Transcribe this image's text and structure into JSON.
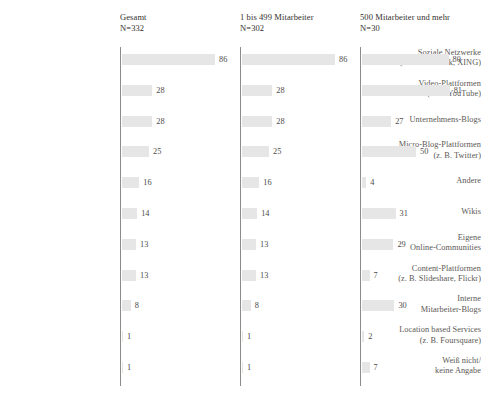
{
  "chart_data": {
    "type": "bar",
    "title": "",
    "xlabel": "",
    "ylabel": "",
    "grid": false,
    "legend_position": "top",
    "orientation": "horizontal",
    "xlim": [
      0,
      100
    ],
    "value_unit": "percent",
    "categories": [
      {
        "line1": "Soziale Netzwerke",
        "line2": "(z. B. Facebook, XING)"
      },
      {
        "line1": "Video-Plattformen",
        "line2": "(z. B. YouTube)"
      },
      {
        "line1": "Unternehmens-Blogs",
        "line2": ""
      },
      {
        "line1": "Micro-Blog-Plattformen",
        "line2": "(z. B. Twitter)"
      },
      {
        "line1": "Andere",
        "line2": ""
      },
      {
        "line1": "Wikis",
        "line2": ""
      },
      {
        "line1": "Eigene",
        "line2": "Online-Communities"
      },
      {
        "line1": "Content-Plattformen",
        "line2": "(z. B. Slideshare, Flickr)"
      },
      {
        "line1": "Interne",
        "line2": "Mitarbeiter-Blogs"
      },
      {
        "line1": "Location based Services",
        "line2": "(z. B. Foursquare)"
      },
      {
        "line1": "Weiß nicht/",
        "line2": "keine Angabe"
      }
    ],
    "series": [
      {
        "name": "Gesamt",
        "n_label": "N=332",
        "values": [
          86,
          28,
          28,
          25,
          16,
          14,
          13,
          13,
          8,
          1,
          1
        ]
      },
      {
        "name": "1 bis 499 Mitarbeiter",
        "n_label": "N=302",
        "values": [
          86,
          28,
          28,
          25,
          16,
          14,
          13,
          13,
          8,
          1,
          1
        ]
      },
      {
        "name": "500 Mitarbeiter und mehr",
        "n_label": "N=30",
        "values": [
          80,
          81,
          27,
          50,
          4,
          31,
          29,
          7,
          30,
          2,
          7
        ]
      }
    ],
    "colors": {
      "bar": "#e6e6e6",
      "axis": "#8e8b88",
      "label_text": "#5b5855",
      "header_text": "#332f2e",
      "value_text": "#4e4b49",
      "background": "#ffffff"
    }
  }
}
